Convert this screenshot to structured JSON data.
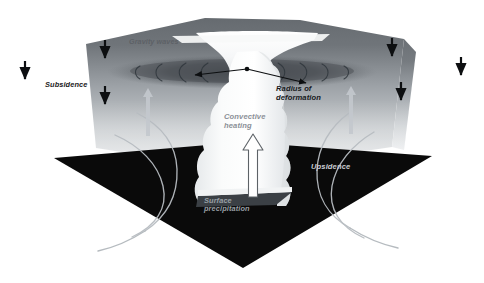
{
  "figure": {
    "width": 484,
    "height": 283,
    "background_color": "#ffffff"
  },
  "labels": {
    "subsidence": "Subsidence",
    "gravity_waves": "Gravity waves",
    "radius_of_deformation": "Radius of\ndeformation",
    "convective_heating": "Convective\nheating",
    "upsidence": "Upsidence",
    "surface_precipitation": "Surface\nprecipitation"
  },
  "colors": {
    "slab_top": "#6c7176",
    "slab_bottom": "#d9dcdf",
    "ground_plane": "#0b0b0b",
    "cloud": "#f2f4f5",
    "anvil": "#fbfcfc",
    "arrow_dark": "#111111",
    "arrow_light": "#c9ced3",
    "flow_line": "#b9bfc4",
    "wave_arc": "#3e454b",
    "halo": "#55595e",
    "leader_line": "#0d0f11"
  },
  "elements": {
    "subsidence_arrows": [
      {
        "name": "subsidence-arrow-outer-left",
        "x": 25,
        "y": 61,
        "length": 22
      },
      {
        "name": "subsidence-arrow-inner-left-upper",
        "x": 105,
        "y": 38,
        "length": 22
      },
      {
        "name": "subsidence-arrow-inner-left-lower",
        "x": 105,
        "y": 85,
        "length": 22
      },
      {
        "name": "subsidence-arrow-inner-right-upper",
        "x": 392,
        "y": 38,
        "length": 22
      },
      {
        "name": "subsidence-arrow-inner-right-lower",
        "x": 401,
        "y": 80,
        "length": 22
      },
      {
        "name": "subsidence-arrow-outer-right",
        "x": 461,
        "y": 56,
        "length": 22
      }
    ],
    "upsidence_arrows": [
      {
        "name": "upsidence-arrow-left",
        "x": 148,
        "y": 95
      },
      {
        "name": "upsidence-arrow-right",
        "x": 351,
        "y": 92
      }
    ],
    "convective_heating_arrow": {
      "name": "convective-heating-arrow",
      "x": 253,
      "y": 143
    },
    "gravity_wave_arc_count": 8,
    "cloud_tower_lobes": 9
  }
}
